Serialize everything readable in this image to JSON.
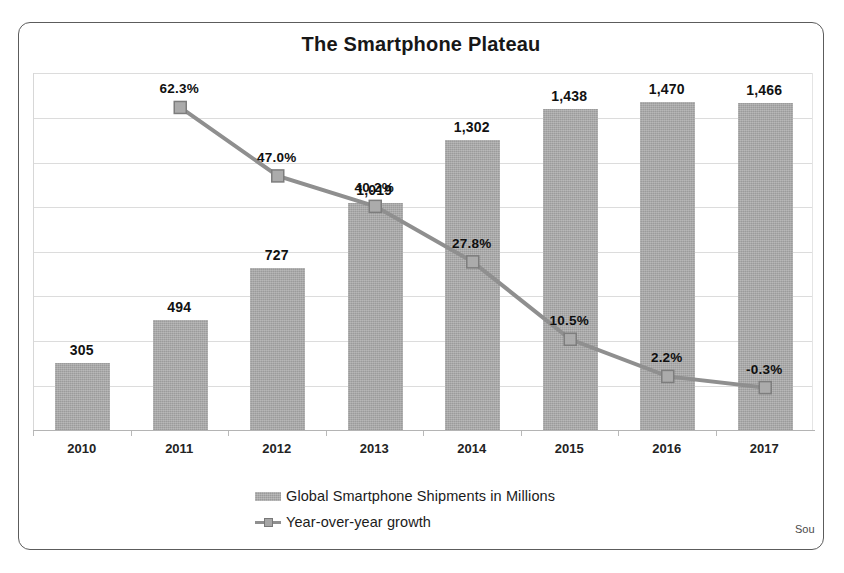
{
  "top_clipped_text": "",
  "source_note": "Sou",
  "chart_data": {
    "type": "bar",
    "title": "The Smartphone Plateau",
    "xlabel": "",
    "ylabel": "",
    "grid": true,
    "legend_position": "bottom",
    "categories": [
      "2010",
      "2011",
      "2012",
      "2013",
      "2014",
      "2015",
      "2016",
      "2017"
    ],
    "ylim": [
      0,
      1600
    ],
    "y2lim": [
      -10,
      70
    ],
    "series": [
      {
        "name": "Global Smartphone Shipments in Millions",
        "type": "bar",
        "color": "#9b9b9b",
        "values": [
          305,
          494,
          727,
          1019,
          1302,
          1438,
          1470,
          1466
        ],
        "labels": [
          "305",
          "494",
          "727",
          "1,019",
          "1,302",
          "1,438",
          "1,470",
          "1,466"
        ]
      },
      {
        "name": "Year-over-year growth",
        "type": "line",
        "color": "#8f8f8f",
        "values": [
          null,
          62.3,
          47.0,
          40.2,
          27.8,
          10.5,
          2.2,
          -0.3
        ],
        "labels": [
          "",
          "62.3%",
          "47.0%",
          "40.2%",
          "27.8%",
          "10.5%",
          "2.2%",
          "-0.3%"
        ]
      }
    ]
  },
  "legend": {
    "bars_label": "Global Smartphone Shipments in Millions",
    "line_label": "Year-over-year growth"
  }
}
